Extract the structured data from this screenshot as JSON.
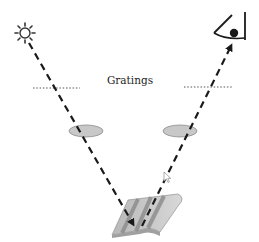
{
  "diagram": {
    "labels": {
      "gratings": "Gratings"
    },
    "nodes": [
      {
        "id": "light-source",
        "icon": "sun-icon",
        "label": ""
      },
      {
        "id": "observer",
        "icon": "eye-icon",
        "label": ""
      },
      {
        "id": "grating-left",
        "shape": "dotted-line",
        "label": ""
      },
      {
        "id": "grating-right",
        "shape": "dotted-line",
        "label": ""
      },
      {
        "id": "lens-left",
        "shape": "ellipse",
        "label": ""
      },
      {
        "id": "lens-right",
        "shape": "ellipse",
        "label": ""
      },
      {
        "id": "grating-surface",
        "shape": "ridged-surface",
        "label": ""
      }
    ],
    "edges": [
      {
        "from": "light-source",
        "to": "grating-surface",
        "style": "dashed",
        "arrow": "end"
      },
      {
        "from": "grating-surface",
        "to": "observer",
        "style": "dashed",
        "arrow": "end"
      }
    ],
    "colors": {
      "line": "#1a1a1a",
      "lens_fill": "#c8c8c8",
      "lens_stroke": "#8a8a8a",
      "surface_light": "#c9c9c9",
      "surface_dark": "#8e8e8e",
      "text": "#222222"
    }
  }
}
